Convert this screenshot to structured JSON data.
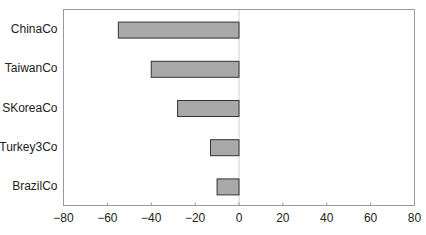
{
  "chart_data": {
    "type": "bar",
    "orientation": "horizontal",
    "title": "",
    "xlabel": "",
    "ylabel": "",
    "categories": [
      "ChinaCo",
      "TaiwanCo",
      "SKoreaCo",
      "Turkey3Co",
      "BrazilCo"
    ],
    "values": [
      -55,
      -40,
      -28,
      -13,
      -10
    ],
    "xlim": [
      -80,
      80
    ],
    "xticks": [
      -80,
      -60,
      -40,
      -20,
      0,
      20,
      40,
      60,
      80
    ],
    "xtick_labels": [
      "−80",
      "−60",
      "−40",
      "−20",
      "0",
      "20",
      "40",
      "60",
      "80"
    ],
    "grid": false,
    "legend": null,
    "colors": {
      "bar_fill": "#a9a9a9",
      "bar_edge": "#333333",
      "frame": "#9a9a9a"
    }
  }
}
